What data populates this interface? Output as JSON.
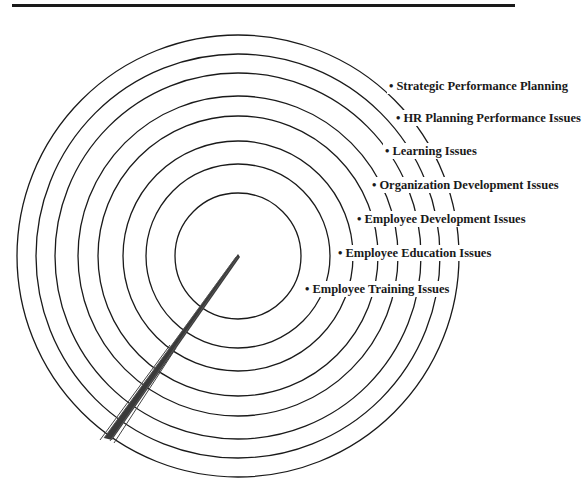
{
  "diagram": {
    "type": "concentric-rings-target",
    "center": {
      "x": 238,
      "y": 256
    },
    "ring_radii": [
      63,
      92,
      115,
      140,
      160,
      183,
      202,
      221
    ],
    "stroke_color": "#1a1a1a",
    "pointer": {
      "tip": {
        "x": 238,
        "y": 255
      },
      "tail": {
        "x": 108,
        "y": 440
      }
    },
    "labels": [
      {
        "text": "Strategic Performance Planning",
        "x": 387,
        "y": 86
      },
      {
        "text": "HR Planning Performance Issues",
        "x": 394,
        "y": 118
      },
      {
        "text": "Learning Issues",
        "x": 383,
        "y": 151
      },
      {
        "text": "Organization Development Issues",
        "x": 370,
        "y": 185
      },
      {
        "text": "Employee Development Issues",
        "x": 355,
        "y": 219
      },
      {
        "text": "Employee Education Issues",
        "x": 336,
        "y": 253
      },
      {
        "text": "Employee Training Issues",
        "x": 303,
        "y": 289
      }
    ],
    "bullet": "•"
  }
}
